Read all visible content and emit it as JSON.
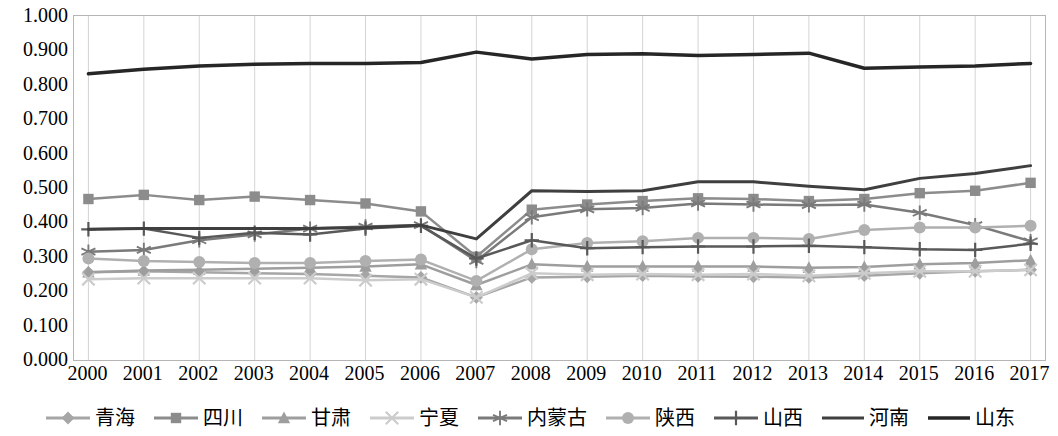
{
  "chart_data": {
    "type": "line",
    "title": "",
    "xlabel": "",
    "ylabel": "",
    "grid": "vertical",
    "legend_position": "bottom",
    "xlim": [
      2000,
      2017
    ],
    "ylim": [
      0.0,
      1.0
    ],
    "ytick_labels": [
      "0.000",
      "0.100",
      "0.200",
      "0.300",
      "0.400",
      "0.500",
      "0.600",
      "0.700",
      "0.800",
      "0.900",
      "1.000"
    ],
    "ytick_values": [
      0.0,
      0.1,
      0.2,
      0.3,
      0.4,
      0.5,
      0.6,
      0.7,
      0.8,
      0.9,
      1.0
    ],
    "categories": [
      2000,
      2001,
      2002,
      2003,
      2004,
      2005,
      2006,
      2007,
      2008,
      2009,
      2010,
      2011,
      2012,
      2013,
      2014,
      2015,
      2016,
      2017
    ],
    "xtick_labels": [
      "2000",
      "2001",
      "2002",
      "2003",
      "2004",
      "2005",
      "2006",
      "2007",
      "2008",
      "2009",
      "2010",
      "2011",
      "2012",
      "2013",
      "2014",
      "2015",
      "2016",
      "2017"
    ],
    "series": [
      {
        "name": "青海",
        "marker": "diamond",
        "color": "#a6a6a6",
        "width": 2.5,
        "values": [
          0.255,
          0.258,
          0.255,
          0.252,
          0.25,
          0.245,
          0.24,
          0.182,
          0.24,
          0.242,
          0.245,
          0.243,
          0.242,
          0.24,
          0.245,
          0.252,
          0.258,
          0.262
        ]
      },
      {
        "name": "四川",
        "marker": "square",
        "color": "#8c8c8c",
        "width": 2.5,
        "values": [
          0.468,
          0.48,
          0.465,
          0.475,
          0.465,
          0.455,
          0.432,
          0.3,
          0.437,
          0.452,
          0.462,
          0.47,
          0.468,
          0.462,
          0.468,
          0.485,
          0.492,
          0.515
        ]
      },
      {
        "name": "甘肃",
        "marker": "triangle",
        "color": "#9e9e9e",
        "width": 2.5,
        "values": [
          0.255,
          0.26,
          0.262,
          0.265,
          0.268,
          0.272,
          0.278,
          0.218,
          0.278,
          0.272,
          0.272,
          0.272,
          0.272,
          0.268,
          0.27,
          0.278,
          0.282,
          0.29
        ]
      },
      {
        "name": "宁夏",
        "marker": "x",
        "color": "#cccccc",
        "width": 2.5,
        "values": [
          0.235,
          0.238,
          0.238,
          0.238,
          0.238,
          0.232,
          0.235,
          0.182,
          0.252,
          0.248,
          0.25,
          0.248,
          0.25,
          0.245,
          0.252,
          0.258,
          0.258,
          0.262
        ]
      },
      {
        "name": "内蒙古",
        "marker": "asterisk",
        "color": "#7a7a7a",
        "width": 2.5,
        "values": [
          0.315,
          0.32,
          0.348,
          0.365,
          0.382,
          0.388,
          0.392,
          0.288,
          0.415,
          0.438,
          0.442,
          0.455,
          0.452,
          0.45,
          0.452,
          0.428,
          0.392,
          0.345
        ]
      },
      {
        "name": "陕西",
        "marker": "circle",
        "color": "#b0b0b0",
        "width": 2.5,
        "values": [
          0.295,
          0.288,
          0.285,
          0.282,
          0.282,
          0.288,
          0.292,
          0.23,
          0.322,
          0.34,
          0.345,
          0.355,
          0.355,
          0.352,
          0.378,
          0.385,
          0.385,
          0.39
        ]
      },
      {
        "name": "山西",
        "marker": "plus",
        "color": "#595959",
        "width": 2.5,
        "values": [
          0.38,
          0.382,
          0.355,
          0.37,
          0.365,
          0.382,
          0.39,
          0.295,
          0.348,
          0.325,
          0.328,
          0.33,
          0.33,
          0.332,
          0.328,
          0.322,
          0.32,
          0.338
        ]
      },
      {
        "name": "河南",
        "marker": "none",
        "color": "#3f3f3f",
        "width": 3.0,
        "values": [
          0.38,
          0.382,
          0.382,
          0.382,
          0.382,
          0.385,
          0.392,
          0.352,
          0.492,
          0.49,
          0.492,
          0.518,
          0.518,
          0.505,
          0.495,
          0.528,
          0.542,
          0.565
        ]
      },
      {
        "name": "山东",
        "marker": "none",
        "color": "#262626",
        "width": 3.5,
        "values": [
          0.832,
          0.845,
          0.855,
          0.86,
          0.862,
          0.862,
          0.865,
          0.895,
          0.875,
          0.888,
          0.89,
          0.885,
          0.888,
          0.892,
          0.848,
          0.852,
          0.855,
          0.862
        ]
      }
    ]
  }
}
